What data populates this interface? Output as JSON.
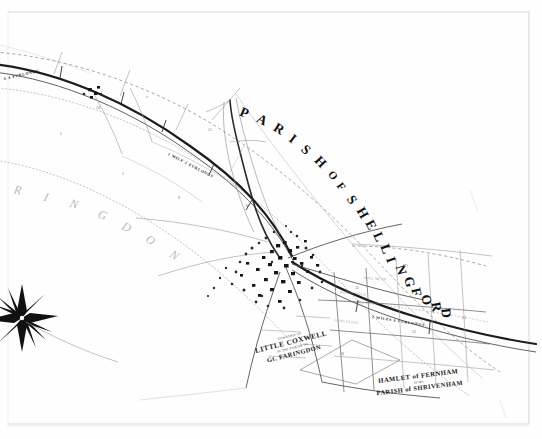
{
  "document": {
    "kind": "scanned-antique-map",
    "sheet_width": 542,
    "sheet_height": 439,
    "paper_color": "#fefefe",
    "ink_color": "#1a1a1a",
    "frame_color": "#d8d8d8"
  },
  "labels": {
    "parish_arc": {
      "text": "PARISH OF SHELLINGFORD",
      "letters": [
        "P",
        "A",
        "R",
        "I",
        "S",
        "H",
        "O",
        "F",
        "S",
        "H",
        "E",
        "L",
        "L",
        "I",
        "N",
        "G",
        "F",
        "O",
        "R",
        "D"
      ],
      "style": "curved-bold-serif"
    },
    "faringdon_arc": {
      "text": "RINGDON",
      "letters": [
        "R",
        "I",
        "N",
        "G",
        "D",
        "O",
        "N"
      ],
      "style": "curved-faint-italic"
    },
    "township": {
      "prefix": "Township of",
      "name": "LITTLE COXWELL",
      "middle": "in the Parish of",
      "parish": "Gt. FARINGDON"
    },
    "hamlet": {
      "line_1": "HAMLET of FERNHAM",
      "line_2": "in the",
      "line_3": "PARISH of SHRIVENHAM"
    },
    "distances": [
      {
        "text": "6 4 FURLONGS",
        "x": 4,
        "y": 77,
        "rotate": -13
      },
      {
        "text": "1 MILE 2 FURLONGS",
        "x": 168,
        "y": 152,
        "rotate": 27
      },
      {
        "text": "2 MILES 6 FURLONGS",
        "x": 372,
        "y": 315,
        "rotate": 9
      }
    ],
    "plot_numbers": [
      {
        "n": "14",
        "x": 96,
        "y": 106
      },
      {
        "n": "7",
        "x": 146,
        "y": 96
      },
      {
        "n": "21",
        "x": 208,
        "y": 128
      },
      {
        "n": "3",
        "x": 122,
        "y": 172
      },
      {
        "n": "9",
        "x": 178,
        "y": 196
      },
      {
        "n": "26",
        "x": 245,
        "y": 204
      },
      {
        "n": "32",
        "x": 355,
        "y": 286
      },
      {
        "n": "41",
        "x": 404,
        "y": 264
      },
      {
        "n": "33",
        "x": 412,
        "y": 330
      },
      {
        "n": "52",
        "x": 462,
        "y": 316
      },
      {
        "n": "18",
        "x": 340,
        "y": 352
      },
      {
        "n": "5",
        "x": 60,
        "y": 132
      }
    ],
    "field_names": [
      {
        "text": "NORTH FIELD",
        "x": 340,
        "y": 290,
        "rotate": 6
      },
      {
        "text": "MILL MEAD",
        "x": 364,
        "y": 276,
        "rotate": 4
      },
      {
        "text": "LONG CLOSE",
        "x": 334,
        "y": 318,
        "rotate": 7
      }
    ]
  },
  "features": {
    "compass_rose": {
      "name": "compass-rose",
      "points": 8,
      "cx": 22,
      "cy": 318
    },
    "village_cluster": {
      "name": "shellingford-village",
      "cx": 284,
      "cy": 268
    },
    "turnpike_road": {
      "name": "turnpike-road",
      "style": "bold-double-line"
    },
    "stream": {
      "name": "stream-watercourse",
      "style": "stippled-line"
    }
  }
}
